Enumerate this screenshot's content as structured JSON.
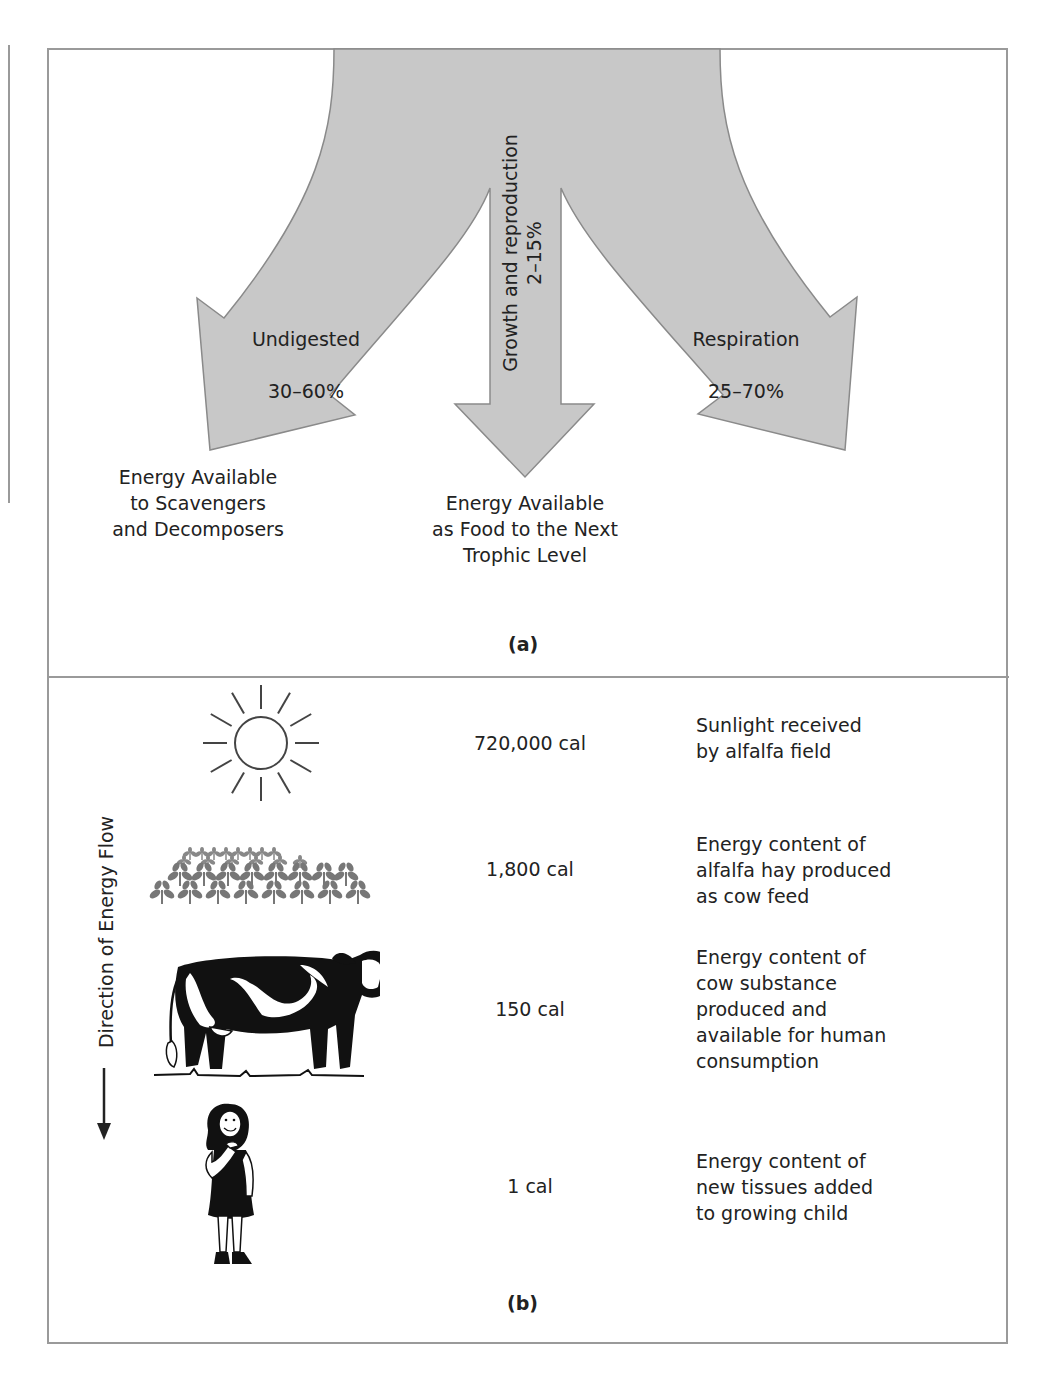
{
  "panel_a": {
    "label": "(a)",
    "fill_color": "#c8c8c8",
    "stroke_color": "#8a8a8a",
    "arrows": {
      "left": {
        "name": "Undigested",
        "range": "30–60%"
      },
      "center": {
        "name": "Growth and reproduction",
        "range": "2–15%"
      },
      "right": {
        "name": "Respiration",
        "range": "25–70%"
      }
    },
    "destinations": {
      "left": "Energy Available\nto Scavengers\nand Decomposers",
      "center": "Energy Available\nas Food to the Next\nTrophic Level"
    }
  },
  "panel_b": {
    "label": "(b)",
    "axis_label": "Direction of Energy Flow",
    "levels": [
      {
        "icon": "sun-icon",
        "energy": "720,000 cal",
        "description": "Sunlight received\nby alfalfa field"
      },
      {
        "icon": "alfalfa-icon",
        "energy": "1,800 cal",
        "description": "Energy content of\nalfalfa hay produced\nas cow feed"
      },
      {
        "icon": "cow-icon",
        "energy": "150 cal",
        "description": "Energy content of\ncow substance\nproduced and\navailable for human\nconsumption"
      },
      {
        "icon": "child-icon",
        "energy": "1 cal",
        "description": "Energy content of\nnew tissues added\nto growing child"
      }
    ]
  }
}
